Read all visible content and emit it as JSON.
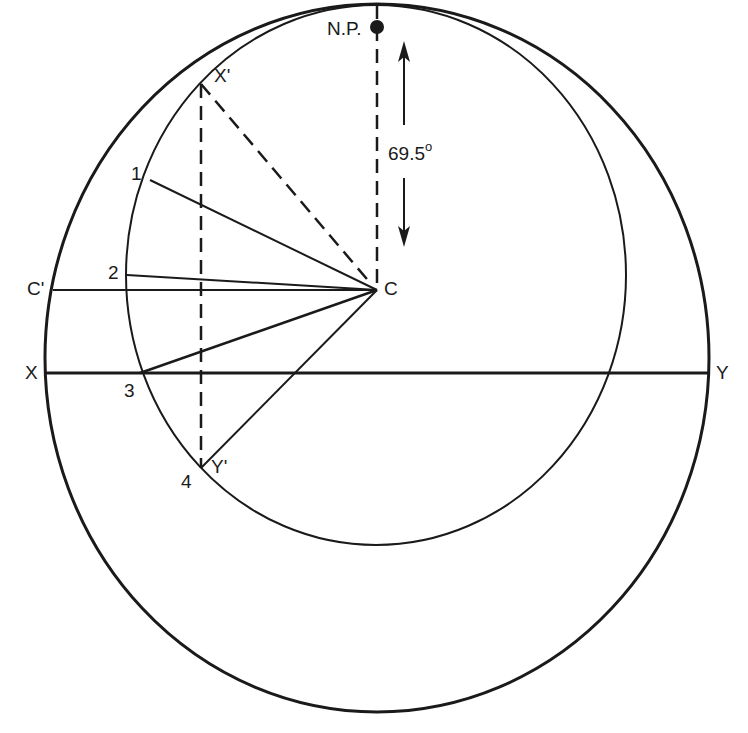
{
  "diagram": {
    "type": "stereographic projection construction",
    "labels": {
      "north_pole": "N.P.",
      "center": "C",
      "c_prime": "C'",
      "x": "X",
      "y": "Y",
      "x_prime": "X'",
      "y_prime": "Y'",
      "p1": "1",
      "p2": "2",
      "p3": "3",
      "p4": "4",
      "angle_value": "69.5",
      "angle_unit": "o"
    },
    "colors": {
      "ink": "#1a1a1a",
      "background": "#ffffff"
    }
  }
}
